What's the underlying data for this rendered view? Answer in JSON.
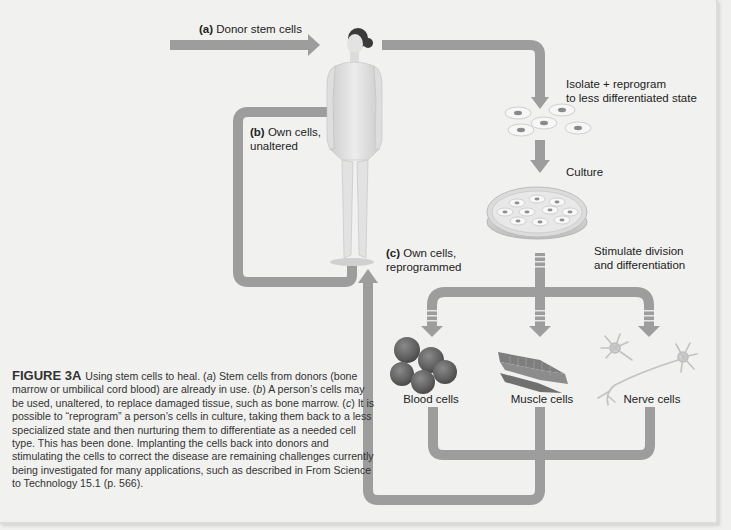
{
  "figure": {
    "title": "FIGURE 3A",
    "caption_parts": [
      {
        "text": "Using stem cells to heal. (",
        "italic": false
      },
      {
        "text": "a",
        "italic": true
      },
      {
        "text": ") Stem cells from donors (bone marrow or umbilical cord blood) are already in use. (",
        "italic": false
      },
      {
        "text": "b",
        "italic": true
      },
      {
        "text": ") A person’s cells may be used, unaltered, to replace damaged tissue, such as bone marrow. (",
        "italic": false
      },
      {
        "text": "c",
        "italic": true
      },
      {
        "text": ") It is possible to “reprogram” a person’s cells in culture, taking them back to a less specialized state and then nurturing them to differentiate as a needed cell type. This has been done. Implanting the cells back into donors and stimulating the cells to correct the disease are remaining challenges currently being investigated for many applications, such as described in From Science to Technology 15.1 (p. 566).",
        "italic": false
      }
    ]
  },
  "labels": {
    "a": {
      "prefix": "(a)",
      "text": "Donor stem cells"
    },
    "b": {
      "prefix": "(b)",
      "line1": "Own cells,",
      "line2": "unaltered"
    },
    "c": {
      "prefix": "(c)",
      "line1": "Own cells,",
      "line2": "reprogrammed"
    },
    "isolate": {
      "line1": "Isolate + reprogram",
      "line2": "to less differentiated state"
    },
    "culture": "Culture",
    "stimulate": {
      "line1": "Stimulate division",
      "line2": "and differentiation"
    }
  },
  "cell_types": [
    {
      "name": "Blood cells",
      "icon": "blood-cells-icon"
    },
    {
      "name": "Muscle cells",
      "icon": "muscle-cells-icon"
    },
    {
      "name": "Nerve cells",
      "icon": "nerve-cells-icon"
    }
  ],
  "colors": {
    "arrow": "#9a9a9a",
    "background": "#f1f1f0",
    "blood_cell": "#6e6e6e",
    "text": "#222222"
  }
}
